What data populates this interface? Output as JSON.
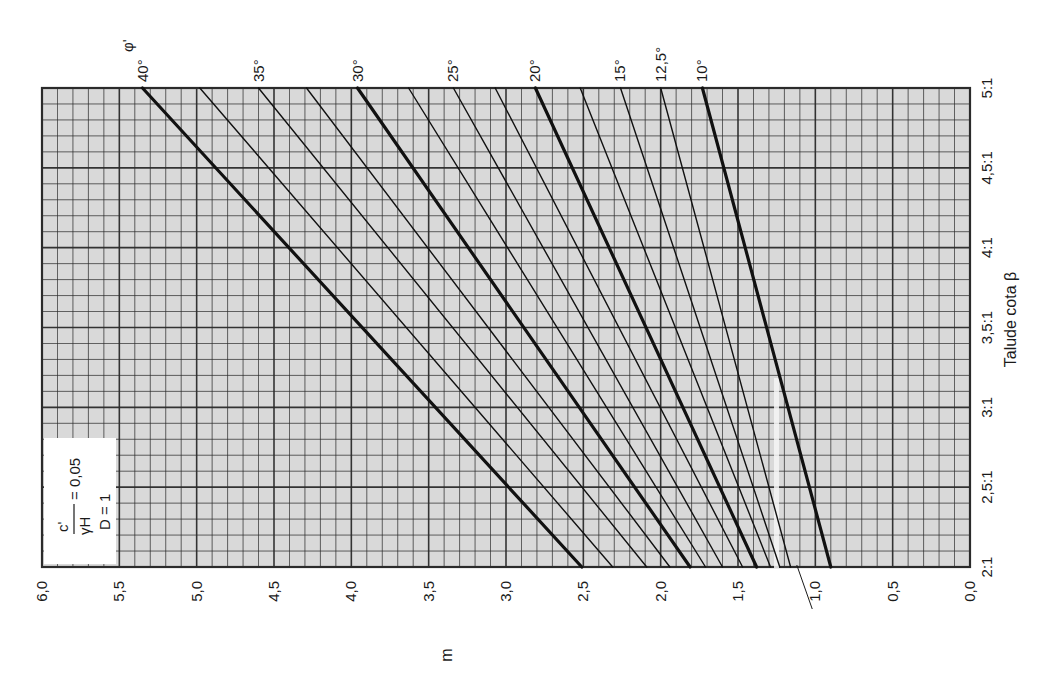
{
  "chart_data": {
    "type": "line",
    "orientation": "rotated-90",
    "title": "",
    "annotation_box": {
      "ratio_numerator": "c'",
      "ratio_denominator": "γH",
      "ratio_value": "= 0,05",
      "depth_factor": "D = 1"
    },
    "xlabel": "Talude cota β",
    "ylabel": "m",
    "x_ticks": [
      "2:1",
      "2,5:1",
      "3:1",
      "3,5:1",
      "4:1",
      "4,5:1",
      "5:1"
    ],
    "x_values": [
      2.0,
      2.5,
      3.0,
      3.5,
      4.0,
      4.5,
      5.0
    ],
    "y_ticks": [
      "0,0",
      "0,5",
      "1,0",
      "1,5",
      "2,0",
      "2,5",
      "3,0",
      "3,5",
      "4,0",
      "4,5",
      "5,0",
      "5,5",
      "6,0"
    ],
    "ylim": [
      0,
      6
    ],
    "xlim": [
      2,
      5
    ],
    "grid": true,
    "grid_minor_step_y": 0.1,
    "grid_minor_step_x": 0.1,
    "legend_title": "φ'",
    "series": [
      {
        "name": "40°",
        "label": "40°",
        "labeled": true,
        "thick": true,
        "x": [
          2,
          5
        ],
        "values": [
          2.51,
          5.35
        ]
      },
      {
        "name": "37.5°",
        "label": "",
        "labeled": false,
        "thick": false,
        "x": [
          2,
          5
        ],
        "values": [
          2.31,
          4.98
        ]
      },
      {
        "name": "35°",
        "label": "35°",
        "labeled": true,
        "thick": false,
        "x": [
          2,
          5
        ],
        "values": [
          2.09,
          4.6
        ]
      },
      {
        "name": "32.5°",
        "label": "",
        "labeled": false,
        "thick": false,
        "x": [
          2,
          5
        ],
        "values": [
          1.94,
          4.29
        ]
      },
      {
        "name": "30°",
        "label": "30°",
        "labeled": true,
        "thick": true,
        "x": [
          2,
          5
        ],
        "values": [
          1.81,
          3.96
        ]
      },
      {
        "name": "27.5°",
        "label": "",
        "labeled": false,
        "thick": false,
        "x": [
          2,
          5
        ],
        "values": [
          1.71,
          3.63
        ]
      },
      {
        "name": "25°",
        "label": "25°",
        "labeled": true,
        "thick": false,
        "x": [
          2,
          5
        ],
        "values": [
          1.6,
          3.34
        ]
      },
      {
        "name": "22.5°",
        "label": "",
        "labeled": false,
        "thick": false,
        "x": [
          2,
          5
        ],
        "values": [
          1.47,
          3.07
        ]
      },
      {
        "name": "20°",
        "label": "20°",
        "labeled": true,
        "thick": true,
        "x": [
          2,
          5
        ],
        "values": [
          1.38,
          2.81
        ]
      },
      {
        "name": "17.5°",
        "label": "",
        "labeled": false,
        "thick": false,
        "x": [
          2,
          5
        ],
        "values": [
          1.29,
          2.52
        ]
      },
      {
        "name": "15°",
        "label": "15°",
        "labeled": true,
        "thick": false,
        "x": [
          2,
          5
        ],
        "values": [
          1.23,
          2.26
        ]
      },
      {
        "name": "12.5°",
        "label": "12,5°",
        "labeled": true,
        "thick": false,
        "x": [
          2,
          5
        ],
        "values": [
          1.16,
          2.0
        ]
      },
      {
        "name": "10°",
        "label": "10°",
        "labeled": true,
        "thick": true,
        "x": [
          2,
          5
        ],
        "values": [
          0.9,
          1.73
        ]
      }
    ],
    "pointer_note": "thin leader line from near m=1.1 at 2:1 down to the 1,0 tick label"
  },
  "colors": {
    "grid_background": "#d9d9d9",
    "grid_line": "#2b2b2b",
    "curve": "#111111",
    "text": "#1a1a1a",
    "label_box": "#ffffff"
  }
}
